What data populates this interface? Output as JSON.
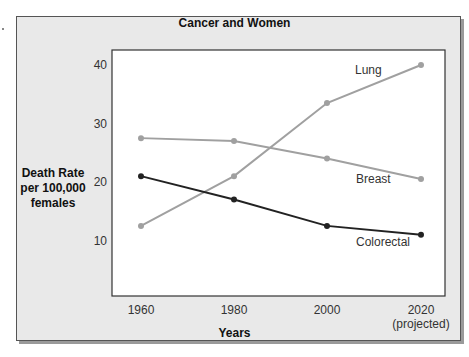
{
  "chart_data": {
    "type": "line",
    "title": "Cancer and Women",
    "xlabel": "Years",
    "ylabel": "Death Rate per 100,000 females",
    "ylabel_lines": [
      "Death Rate",
      "per 100,000",
      "females"
    ],
    "categories": [
      "1960",
      "1980",
      "2000",
      "2020"
    ],
    "category_sublabels": [
      "",
      "",
      "",
      "(projected)"
    ],
    "yticks": [
      10,
      20,
      30,
      40
    ],
    "ylim": [
      5,
      42.5
    ],
    "grid": false,
    "legend": "inline labels",
    "series": [
      {
        "name": "Lung",
        "color": "#a0a0a0",
        "values": [
          12.5,
          21,
          33.5,
          40
        ]
      },
      {
        "name": "Breast",
        "color": "#a0a0a0",
        "values": [
          27.5,
          27,
          24,
          20.5
        ]
      },
      {
        "name": "Colorectal",
        "color": "#222222",
        "values": [
          21,
          17,
          12.5,
          11
        ]
      }
    ]
  }
}
